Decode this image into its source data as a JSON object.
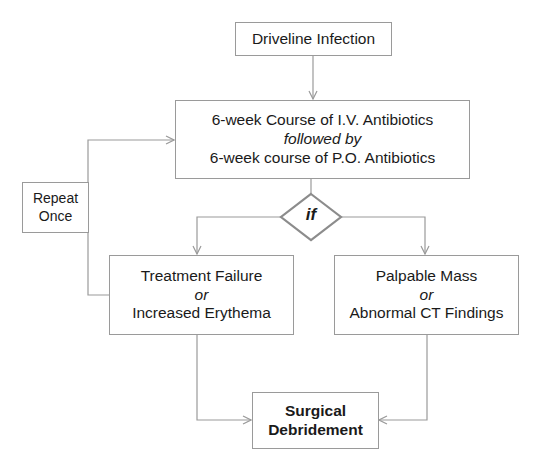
{
  "diagram": {
    "type": "flowchart",
    "start": {
      "label": "Driveline Infection"
    },
    "treatment": {
      "line1": "6-week Course of I.V. Antibiotics",
      "connector": "followed by",
      "line2": "6-week course of P.O. Antibiotics"
    },
    "decision": {
      "label": "if"
    },
    "repeat": {
      "line1": "Repeat",
      "line2": "Once"
    },
    "left_branch": {
      "line1": "Treatment Failure",
      "connector": "or",
      "line2": "Increased Erythema"
    },
    "right_branch": {
      "line1": "Palpable Mass",
      "connector": "or",
      "line2": "Abnormal CT Findings"
    },
    "end": {
      "line1": "Surgical",
      "line2": "Debridement"
    },
    "colors": {
      "line": "#9a9a9a",
      "diamond_border": "#8c8c8c",
      "text": "#1a1a1a"
    }
  }
}
